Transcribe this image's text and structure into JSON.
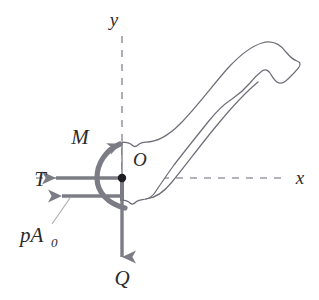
{
  "figure": {
    "background_color": "#ffffff",
    "axes": {
      "y_label": "y",
      "x_label": "x",
      "origin_label": "O",
      "line_color": "#8c8c96",
      "line_style": "dashed"
    },
    "body": {
      "name": "hook-outline",
      "outline_color": "#6e6e78",
      "fill_color": "#ffffff",
      "cut_face_color": "#3d3d44"
    },
    "forces": [
      {
        "id": "moment",
        "label": "M",
        "type": "moment-couple",
        "direction": "counterclockwise",
        "color": "#7c7c86"
      },
      {
        "id": "tension",
        "label": "T",
        "type": "force",
        "direction": "left",
        "color": "#7c7c86"
      },
      {
        "id": "pressure",
        "label": "pA",
        "label_subscript": "0",
        "type": "force",
        "direction": "left",
        "color": "#7c7c86"
      },
      {
        "id": "shear",
        "label": "Q",
        "type": "force",
        "direction": "down",
        "color": "#7c7c86"
      }
    ]
  }
}
